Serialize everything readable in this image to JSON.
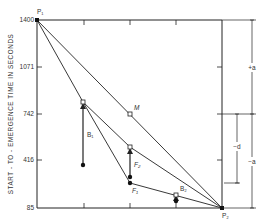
{
  "diagram": {
    "y_axis_label": "START - TO - EMERGENCE  TIME IN SECONDS",
    "y_ticks": [
      "1400",
      "1071",
      "742",
      "416",
      "85"
    ],
    "points": {
      "P1": "P₁",
      "P2": "P₂",
      "M": "M",
      "B1": "B₁",
      "B2": "B₂",
      "F1": "F₁",
      "F2": "F₂"
    },
    "dimensions": {
      "plus_a": "+a",
      "minus_a": "−a",
      "minus_d": "−d"
    },
    "colors": {
      "line": "#222222",
      "text": "#333333"
    }
  }
}
